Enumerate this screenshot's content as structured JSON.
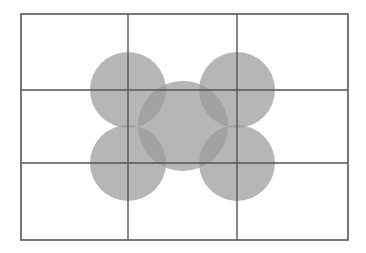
{
  "figure": {
    "name": "overlapping-circles-on-grid",
    "description": "A rectangular frame subdivided by a three-by-three grid, overlaid with five semi-transparent gray circles whose pairwise intersections appear darker.",
    "canvas": {
      "width": 366,
      "height": 253,
      "background": "#ffffff"
    },
    "frame": {
      "x": 21,
      "y": 14,
      "width": 327,
      "height": 226,
      "stroke": "#555555",
      "stroke_width": 1.6,
      "fill": "none"
    },
    "grid": {
      "columns": 3,
      "rows": 3,
      "stroke": "#555555",
      "stroke_width": 1.4,
      "vertical_lines": [
        128,
        237
      ],
      "horizontal_lines": [
        90,
        163
      ]
    },
    "circles": {
      "fill": "#9a9a9a",
      "opacity": 0.72,
      "items": [
        {
          "label": "top-left-circle",
          "cx": 128,
          "cy": 90,
          "r": 38
        },
        {
          "label": "top-right-circle",
          "cx": 237,
          "cy": 90,
          "r": 38
        },
        {
          "label": "bottom-left-circle",
          "cx": 128,
          "cy": 163,
          "r": 38
        },
        {
          "label": "bottom-right-circle",
          "cx": 237,
          "cy": 163,
          "r": 38
        },
        {
          "label": "center-circle",
          "cx": 183,
          "cy": 126,
          "r": 45
        }
      ]
    },
    "colors": {
      "light_gray": "#a6a6a6",
      "dark_overlap_gray": "#6c6c6c",
      "line_gray": "#555555",
      "background_white": "#ffffff"
    }
  }
}
